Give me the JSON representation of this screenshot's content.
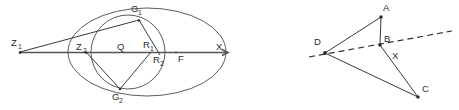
{
  "figure": {
    "background_color": "#ffffff",
    "ink_color": "#2b2b2b",
    "width": 459,
    "height": 110
  },
  "left_diagram": {
    "name": "ellipse-circle-tangent-construction",
    "description": "An ellipse with an inscribed circle, a horizontal axis line, tangent lines from an external point, and labeled points.",
    "axis": {
      "label_right": "X",
      "label_right_x": 218,
      "label_right_y": 51,
      "focus_label": "F",
      "focus_label_x": 180,
      "focus_label_y": 61
    },
    "points": [
      {
        "id": "Z1",
        "base": "Z",
        "sub": "1",
        "x": 20,
        "y": 52,
        "label_x": 11,
        "label_y": 46
      },
      {
        "id": "Z2",
        "base": "Z",
        "sub": "2",
        "x": 86,
        "y": 52,
        "label_x": 78,
        "label_y": 50
      },
      {
        "id": "Q",
        "base": "Q",
        "sub": "",
        "x": 122,
        "y": 52,
        "label_x": 118,
        "label_y": 50
      },
      {
        "id": "R1",
        "base": "R",
        "sub": "1",
        "x": 150,
        "y": 52,
        "label_x": 145,
        "label_y": 48
      },
      {
        "id": "R2",
        "base": "R",
        "sub": "2",
        "x": 159,
        "y": 54,
        "label_x": 155,
        "label_y": 63
      },
      {
        "id": "F",
        "base": "F",
        "sub": "",
        "x": 176,
        "y": 52,
        "label_x": 180,
        "label_y": 61
      },
      {
        "id": "G1",
        "base": "G",
        "sub": "1",
        "x": 139,
        "y": 20,
        "label_x": 131,
        "label_y": 12
      },
      {
        "id": "G2",
        "base": "G",
        "sub": "2",
        "x": 120,
        "y": 89,
        "label_x": 113,
        "label_y": 99
      },
      {
        "id": "X",
        "base": "X",
        "sub": "",
        "x": 224,
        "y": 52,
        "label_x": 218,
        "label_y": 51
      }
    ],
    "ellipse": {
      "cx": 147,
      "cy": 52,
      "rx": 79,
      "ry": 44
    },
    "circle": {
      "cx": 128,
      "cy": 52,
      "r": 37
    }
  },
  "right_diagram": {
    "name": "quadrilateral-diagonal-construction",
    "description": "Triangle D-A-C with interior point B and a dashed line through D, B and X extending beyond.",
    "points": [
      {
        "id": "A",
        "base": "A",
        "x": 381,
        "y": 17,
        "label_x": 385,
        "label_y": 11
      },
      {
        "id": "B",
        "base": "B",
        "x": 380,
        "y": 45,
        "label_x": 385,
        "label_y": 41
      },
      {
        "id": "C",
        "base": "C",
        "x": 418,
        "y": 97,
        "label_x": 423,
        "label_y": 92
      },
      {
        "id": "D",
        "base": "D",
        "x": 325,
        "y": 53,
        "label_x": 316,
        "label_y": 44
      },
      {
        "id": "X",
        "base": "X",
        "x": 396,
        "y": 52,
        "label_x": 393,
        "label_y": 58
      }
    ],
    "dashed_line": {
      "x1": 309,
      "y1": 57,
      "x2": 452,
      "y2": 31
    }
  }
}
